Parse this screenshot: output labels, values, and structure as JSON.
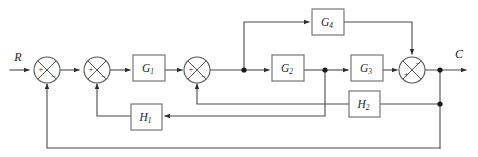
{
  "diagram": {
    "colors": {
      "wire": "#4a4a4a",
      "block_stroke": "#6b6b6b",
      "block_fill": "#ffffff",
      "text": "#1f1f1f",
      "junction_dot": "#1a1a1a",
      "background": "#ffffff"
    },
    "signals": {
      "input": "R",
      "output": "C"
    },
    "blocks": [
      {
        "id": "G1",
        "base": "G",
        "sub": "1",
        "label": "G₁",
        "x": 133,
        "y": 55,
        "w": 32,
        "h": 26
      },
      {
        "id": "G2",
        "base": "G",
        "sub": "2",
        "label": "G₂",
        "x": 272,
        "y": 55,
        "w": 32,
        "h": 26
      },
      {
        "id": "G3",
        "base": "G",
        "sub": "3",
        "label": "G₃",
        "x": 351,
        "y": 55,
        "w": 32,
        "h": 26
      },
      {
        "id": "G4",
        "base": "G",
        "sub": "4",
        "label": "G₄",
        "x": 312,
        "y": 9,
        "w": 32,
        "h": 26
      },
      {
        "id": "H1",
        "base": "H",
        "sub": "1",
        "label": "H₁",
        "x": 131,
        "y": 104,
        "w": 31,
        "h": 26
      },
      {
        "id": "H2",
        "base": "H",
        "sub": "2",
        "label": "H₂",
        "x": 349,
        "y": 91,
        "w": 31,
        "h": 26
      }
    ],
    "summing_junctions": [
      {
        "id": "sum1",
        "cx": 47,
        "cy": 70,
        "r": 13,
        "left_sign": "+",
        "bottom_sign": "−"
      },
      {
        "id": "sum2",
        "cx": 97,
        "cy": 70,
        "r": 13,
        "left_sign": "+",
        "bottom_sign": "−"
      },
      {
        "id": "sum3",
        "cx": 197,
        "cy": 70,
        "r": 13,
        "left_sign": "+",
        "bottom_sign": "−"
      },
      {
        "id": "sum4",
        "cx": 412,
        "cy": 70,
        "r": 13,
        "left_sign": "+",
        "top_sign": "−"
      }
    ],
    "junction_points": [
      {
        "id": "takeoff-g4",
        "x": 244,
        "y": 70
      },
      {
        "id": "takeoff-g2-out",
        "x": 325,
        "y": 70
      },
      {
        "id": "takeoff-c",
        "x": 440,
        "y": 70
      },
      {
        "id": "takeoff-h2",
        "x": 440,
        "y": 104
      }
    ],
    "connections": [
      {
        "id": "r-to-sum1",
        "from": "R",
        "to": "sum1"
      },
      {
        "id": "sum1-to-sum2",
        "from": "sum1",
        "to": "sum2"
      },
      {
        "id": "sum2-to-g1",
        "from": "sum2",
        "to": "G1"
      },
      {
        "id": "g1-to-sum3",
        "from": "G1",
        "to": "sum3"
      },
      {
        "id": "sum3-to-takeoff-g4",
        "from": "sum3",
        "to": "takeoff-g4"
      },
      {
        "id": "takeoff-g4-to-g4",
        "from": "takeoff-g4",
        "to": "G4"
      },
      {
        "id": "takeoff-g4-to-g2",
        "from": "takeoff-g4",
        "to": "G2"
      },
      {
        "id": "g2-to-takeoff",
        "from": "G2",
        "to": "takeoff-g2-out"
      },
      {
        "id": "takeoff-to-g3",
        "from": "takeoff-g2-out",
        "to": "G3"
      },
      {
        "id": "takeoff-to-h1",
        "from": "takeoff-g2-out",
        "to": "H1"
      },
      {
        "id": "g3-to-sum4",
        "from": "G3",
        "to": "sum4"
      },
      {
        "id": "g4-to-sum4",
        "from": "G4",
        "to": "sum4"
      },
      {
        "id": "sum4-to-c",
        "from": "sum4",
        "to": "C"
      },
      {
        "id": "c-to-h2",
        "from": "takeoff-h2",
        "to": "H2"
      },
      {
        "id": "h2-to-sum3",
        "from": "H2",
        "to": "sum3"
      },
      {
        "id": "h1-to-sum2",
        "from": "H1",
        "to": "sum2"
      },
      {
        "id": "c-to-sum1",
        "from": "takeoff-c",
        "to": "sum1"
      }
    ]
  }
}
